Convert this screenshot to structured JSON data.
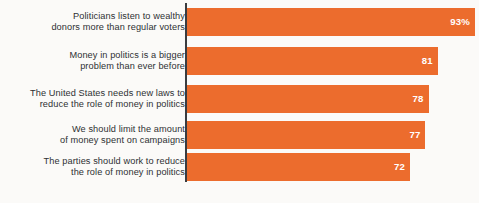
{
  "chart_data": {
    "type": "bar",
    "orientation": "horizontal",
    "title": "",
    "xlabel": "",
    "ylabel": "",
    "xlim": [
      0,
      100
    ],
    "grid": false,
    "legend": null,
    "bar_color": "#ec6c2d",
    "value_label_color": "#ffffff",
    "axis_line_color": "#3a3c40",
    "background_color": "#fbfaf8",
    "categories": [
      "Politicians listen to wealthy\ndonors more than regular voters",
      "Money in politics is a bigger\nproblem than ever before",
      "The United States needs new laws to\nreduce the role of money in politics",
      "We should limit the amount\nof money spent on campaigns",
      "The parties should work to reduce\nthe role of money in politics"
    ],
    "values": [
      93,
      81,
      78,
      77,
      72
    ],
    "value_labels": [
      "93%",
      "81",
      "78",
      "77",
      "72"
    ]
  },
  "bars": [
    {
      "label": "Politicians listen to wealthy\ndonors more than regular voters",
      "value_label": "93%",
      "value": 93
    },
    {
      "label": "Money in politics is a bigger\nproblem than ever before",
      "value_label": "81",
      "value": 81
    },
    {
      "label": "The United States needs new laws to\nreduce the role of money in politics",
      "value_label": "78",
      "value": 78
    },
    {
      "label": "We should limit the amount\nof money spent on campaigns",
      "value_label": "77",
      "value": 77
    },
    {
      "label": "The parties should work to reduce\nthe role of money in politics",
      "value_label": "72",
      "value": 72
    }
  ]
}
